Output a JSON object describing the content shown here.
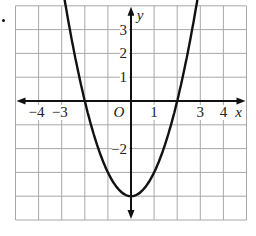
{
  "chart_data": {
    "type": "line",
    "title": "",
    "function": "y = x^2 - 4",
    "xlabel": "x",
    "ylabel": "y",
    "origin_label": "O",
    "xlim": [
      -5,
      5
    ],
    "ylim": [
      -5,
      4
    ],
    "grid": true,
    "x_tick_labels": [
      {
        "value": -4,
        "label": "−4"
      },
      {
        "value": -3,
        "label": "−3"
      },
      {
        "value": 1,
        "label": "1"
      },
      {
        "value": 3,
        "label": "3"
      },
      {
        "value": 4,
        "label": "4"
      }
    ],
    "y_tick_labels": [
      {
        "value": 3,
        "label": "3"
      },
      {
        "value": 2,
        "label": "2"
      },
      {
        "value": 1,
        "label": "1"
      },
      {
        "value": -2,
        "label": "−2"
      }
    ],
    "series": [
      {
        "name": "parabola",
        "x": [
          -2.95,
          -2.5,
          -2,
          -1.5,
          -1,
          -0.5,
          0,
          0.5,
          1,
          1.5,
          2,
          2.5,
          2.95
        ],
        "y": [
          4.7,
          2.25,
          0,
          -1.75,
          -3,
          -3.75,
          -4,
          -3.75,
          -3,
          -1.75,
          0,
          2.25,
          4.7
        ]
      }
    ],
    "key_points": {
      "vertex": [
        0,
        -4
      ],
      "x_intercepts": [
        [
          -2,
          0
        ],
        [
          2,
          0
        ]
      ]
    }
  },
  "colors": {
    "grid": "#a8a8a8",
    "axis": "#111111",
    "curve": "#111111",
    "text": "#222222",
    "background": "#ffffff"
  }
}
